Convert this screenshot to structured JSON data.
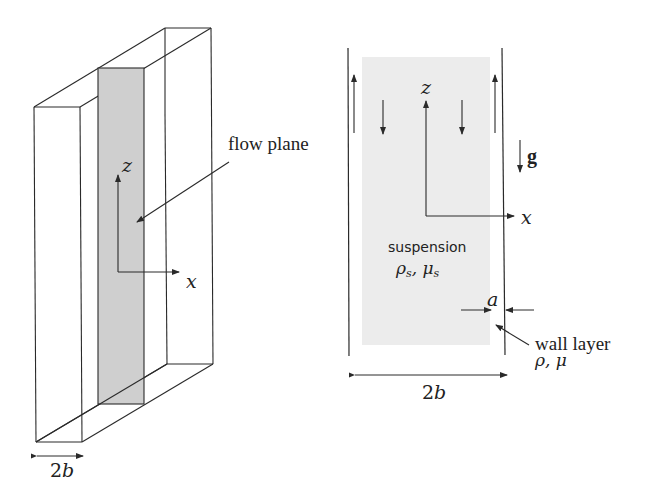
{
  "left_figure": {
    "label_flow_plane": "flow plane",
    "axis_z": "z",
    "axis_x": "x",
    "width_label": "2b"
  },
  "right_figure": {
    "axis_z": "z",
    "axis_x": "x",
    "gravity_label": "g",
    "suspension_label": "suspension",
    "suspension_props": "ρs, μs",
    "gap_label": "a",
    "wall_layer_label": "wall layer",
    "wall_layer_props": "ρ, μ",
    "width_label": "2b"
  },
  "colors": {
    "line": "#2a2a2a",
    "flow_plane_fill": "#cfcfcf",
    "suspension_fill": "#ececec"
  }
}
